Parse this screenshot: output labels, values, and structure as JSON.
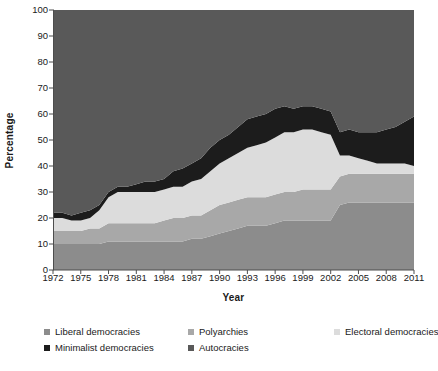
{
  "chart_data": {
    "type": "area",
    "stacked": true,
    "title": "",
    "xlabel": "Year",
    "ylabel": "Percentage",
    "xlim": [
      1972,
      2011
    ],
    "ylim": [
      0,
      100
    ],
    "ytick_step": 10,
    "grid": false,
    "legend_position": "bottom",
    "x": [
      1972,
      1973,
      1974,
      1975,
      1976,
      1977,
      1978,
      1979,
      1980,
      1981,
      1982,
      1983,
      1984,
      1985,
      1986,
      1987,
      1988,
      1989,
      1990,
      1991,
      1992,
      1993,
      1994,
      1995,
      1996,
      1997,
      1998,
      1999,
      2000,
      2001,
      2002,
      2003,
      2004,
      2005,
      2006,
      2007,
      2008,
      2009,
      2010,
      2011
    ],
    "xtick_labels": [
      "1972",
      "1975",
      "1978",
      "1981",
      "1984",
      "1987",
      "1990",
      "1993",
      "1996",
      "1999",
      "2002",
      "2005",
      "2008",
      "2011"
    ],
    "ytick_labels": [
      "0",
      "10",
      "20",
      "30",
      "40",
      "50",
      "60",
      "70",
      "80",
      "90",
      "100"
    ],
    "series": [
      {
        "name": "Liberal democracies",
        "color": "#8c8c8c",
        "values": [
          10,
          10,
          10,
          10,
          10,
          10,
          11,
          11,
          11,
          11,
          11,
          11,
          11,
          11,
          11,
          12,
          12,
          13,
          14,
          15,
          16,
          17,
          17,
          17,
          18,
          19,
          19,
          19,
          19,
          19,
          19,
          25,
          26,
          26,
          26,
          26,
          26,
          26,
          26,
          26
        ]
      },
      {
        "name": "Polyarchies",
        "color": "#a8a8a8",
        "values": [
          5,
          5,
          5,
          5,
          6,
          6,
          7,
          7,
          7,
          7,
          7,
          7,
          8,
          9,
          9,
          9,
          9,
          10,
          11,
          11,
          11,
          11,
          11,
          11,
          11,
          11,
          11,
          12,
          12,
          12,
          12,
          11,
          11,
          11,
          11,
          11,
          11,
          11,
          11,
          11
        ]
      },
      {
        "name": "Electoral democracies",
        "color": "#dcdcdc",
        "values": [
          5,
          5,
          4,
          4,
          4,
          7,
          10,
          12,
          12,
          12,
          12,
          12,
          12,
          12,
          12,
          13,
          14,
          15,
          16,
          17,
          18,
          19,
          20,
          21,
          22,
          23,
          23,
          23,
          23,
          22,
          21,
          8,
          7,
          6,
          5,
          4,
          4,
          4,
          4,
          3
        ]
      },
      {
        "name": "Minimalist democracies",
        "color": "#1c1c1c",
        "values": [
          2,
          2,
          2,
          3,
          3,
          2,
          2,
          2,
          2,
          3,
          4,
          4,
          4,
          6,
          7,
          7,
          8,
          9,
          9,
          9,
          10,
          11,
          11,
          11,
          11,
          10,
          9,
          9,
          9,
          9,
          9,
          9,
          10,
          10,
          11,
          12,
          13,
          14,
          16,
          19
        ]
      },
      {
        "name": "Autocracies",
        "color": "#595959",
        "values": [
          78,
          78,
          79,
          78,
          77,
          75,
          70,
          68,
          68,
          67,
          66,
          66,
          65,
          62,
          61,
          59,
          57,
          53,
          50,
          48,
          45,
          42,
          41,
          40,
          38,
          37,
          38,
          37,
          37,
          38,
          39,
          47,
          46,
          47,
          47,
          47,
          46,
          45,
          43,
          41
        ]
      }
    ]
  },
  "legend": {
    "items": [
      {
        "label": "Liberal democracies",
        "color": "#8c8c8c"
      },
      {
        "label": "Polyarchies",
        "color": "#a8a8a8"
      },
      {
        "label": "Electoral democracies",
        "color": "#dcdcdc"
      },
      {
        "label": "Minimalist democracies",
        "color": "#1c1c1c"
      },
      {
        "label": "Autocracies",
        "color": "#595959"
      }
    ]
  },
  "axes": {
    "x_title": "Year",
    "y_title": "Percentage"
  }
}
